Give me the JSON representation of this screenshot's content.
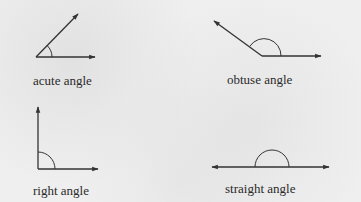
{
  "diagram": {
    "title": "",
    "line_color": "#333333",
    "background_color": "#efefef",
    "panels": [
      {
        "id": "acute",
        "label": "acute angle"
      },
      {
        "id": "obtuse",
        "label": "obtuse angle"
      },
      {
        "id": "right",
        "label": "right angle"
      },
      {
        "id": "straight",
        "label": "straight angle"
      }
    ]
  }
}
